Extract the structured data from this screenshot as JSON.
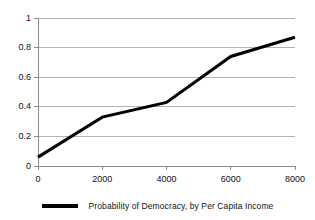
{
  "chart_data": {
    "type": "line",
    "title": "",
    "subtitle": "",
    "xlabel": "",
    "ylabel": "",
    "xlim": [
      0,
      8000
    ],
    "ylim": [
      0,
      1
    ],
    "grid": "horizontal",
    "legend_position": "bottom",
    "x_ticks": [
      0,
      2000,
      4000,
      6000,
      8000
    ],
    "x_tick_labels": [
      "0",
      "2000",
      "4000",
      "6000",
      "8000"
    ],
    "y_ticks": [
      0,
      0.2,
      0.4,
      0.6,
      0.8,
      1
    ],
    "y_tick_labels": [
      "0",
      "0.2",
      "0.4",
      "0.6",
      "0.8",
      "1"
    ],
    "series": [
      {
        "name": "Probability of Democracy, by Per Capita Income",
        "color": "#000000",
        "line_width": 3,
        "x": [
          0,
          2000,
          4000,
          6000,
          8000
        ],
        "values": [
          0.06,
          0.33,
          0.43,
          0.74,
          0.87
        ]
      }
    ]
  },
  "legend": {
    "entries": [
      {
        "label": "Probability of Democracy, by Per Capita Income",
        "marker": "line-swatch",
        "color": "#000000"
      }
    ]
  },
  "axes": {
    "y_axis_labels": [
      "1",
      "0.8",
      "0.6",
      "0.4",
      "0.2",
      "0"
    ],
    "x_axis_labels": [
      "0",
      "2000",
      "4000",
      "6000",
      "8000"
    ]
  },
  "colors": {
    "background": "#ffffff",
    "series_line": "#000000",
    "gridline": "#b3b3b3",
    "axis_line": "#8c8c8c",
    "tick_text": "#111111"
  }
}
